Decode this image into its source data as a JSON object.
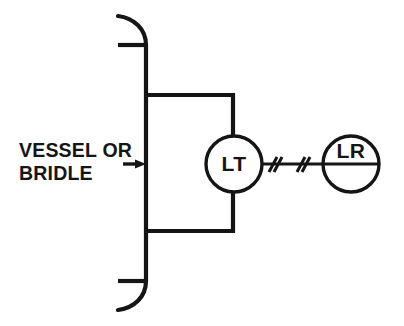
{
  "diagram": {
    "type": "p-and-id",
    "background_color": "#ffffff",
    "line_color": "#151515",
    "annotation": {
      "line1": "VESSEL OR",
      "line2": "BRIDLE"
    },
    "instruments": [
      {
        "tag": "LT",
        "name": "level-transmitter",
        "mounting": "field",
        "has_divider_line": false,
        "center_x": 234,
        "center_y": 164,
        "radius": 28
      },
      {
        "tag": "LR",
        "name": "level-recorder",
        "mounting": "panel",
        "has_divider_line": true,
        "center_x": 351,
        "center_y": 164,
        "radius": 28
      }
    ],
    "connections": [
      {
        "name": "upper-impulse-tap",
        "type": "process-connection",
        "from": "vessel-wall",
        "to": "level-transmitter"
      },
      {
        "name": "lower-impulse-tap",
        "type": "process-connection",
        "from": "vessel-wall",
        "to": "level-transmitter"
      },
      {
        "name": "electric-signal",
        "type": "electrical-signal",
        "from": "LT",
        "to": "LR",
        "hash_mark_count": 2
      }
    ],
    "vessel": {
      "name": "vessel-or-bridle",
      "wall_x": 146,
      "wall_top_y": 45,
      "wall_bottom_y": 281,
      "head_tick_left_x": 118
    }
  }
}
